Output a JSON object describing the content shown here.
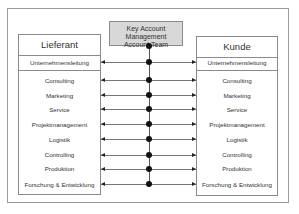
{
  "diagram": {
    "center": {
      "line1": "Key Account Management",
      "line2": "Account Team"
    },
    "left": {
      "title": "Lieferant",
      "management": "Unternehmensleitung",
      "items": [
        "Consulting",
        "Marketing",
        "Service",
        "Projektmanagement",
        "Logistik",
        "Controlling",
        "Produktion",
        "Forschung & Entwicklung"
      ]
    },
    "right": {
      "title": "Kunde",
      "management": "Unternehmensleitung",
      "items": [
        "Consulting",
        "Marketing",
        "Service",
        "Projektmanagement",
        "Logistik",
        "Controlling",
        "Produktion",
        "Forschung & Entwicklung"
      ]
    },
    "connections": [
      {
        "from": "Unternehmensleitung",
        "to": "Unternehmensleitung"
      },
      {
        "from": "Consulting",
        "to": "Consulting"
      },
      {
        "from": "Marketing",
        "to": "Marketing"
      },
      {
        "from": "Service",
        "to": "Service"
      },
      {
        "from": "Projektmanagement",
        "to": "Projektmanagement"
      },
      {
        "from": "Logistik",
        "to": "Logistik"
      },
      {
        "from": "Controlling",
        "to": "Controlling"
      },
      {
        "from": "Produktion",
        "to": "Produktion"
      },
      {
        "from": "Forschung & Entwicklung",
        "to": "Forschung & Entwicklung"
      }
    ],
    "colors": {
      "center_fill": "#d8d8d8",
      "border": "#8a8a8a",
      "dot": "#111111"
    }
  }
}
